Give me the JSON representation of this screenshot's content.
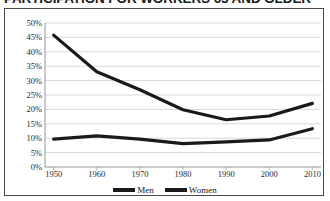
{
  "title": "PARTICIPATION FOR WORKERS 65 AND OLDER",
  "legend": {
    "men_label": "Men",
    "women_label": "Women"
  },
  "axis": {
    "y_ticks": [
      "50%",
      "45%",
      "40%",
      "35%",
      "30%",
      "25%",
      "20%",
      "15%",
      "10%",
      "5%",
      "0%"
    ],
    "x_ticks": [
      "1950",
      "1960",
      "1970",
      "1980",
      "1990",
      "2000",
      "2010"
    ]
  },
  "chart_data": {
    "type": "line",
    "title": "PARTICIPATION FOR WORKERS 65 AND OLDER",
    "xlabel": "",
    "ylabel": "",
    "xlim": [
      1948,
      2012
    ],
    "ylim": [
      0,
      50
    ],
    "y_unit": "percent",
    "grid": true,
    "legend_position": "bottom-center",
    "x": [
      1950,
      1960,
      1970,
      1980,
      1990,
      2000,
      2010
    ],
    "series": [
      {
        "name": "Men",
        "color": "#1a1a1a",
        "values": [
          45.8,
          33.1,
          26.8,
          19.9,
          16.4,
          17.7,
          22.1
        ]
      },
      {
        "name": "Women",
        "color": "#1a1a1a",
        "values": [
          9.7,
          10.8,
          9.7,
          8.1,
          8.7,
          9.4,
          13.3
        ]
      }
    ]
  }
}
